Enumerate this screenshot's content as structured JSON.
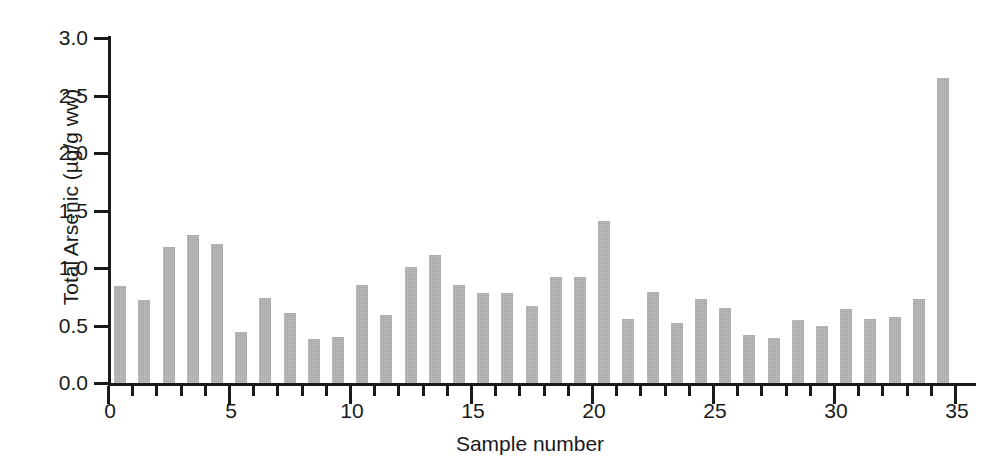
{
  "chart_data": {
    "type": "bar",
    "title": "",
    "xlabel": "Sample number",
    "ylabel": "Total Arsenic (µg/g ww)",
    "xlim": [
      0,
      35
    ],
    "ylim": [
      0.0,
      3.0
    ],
    "grid": false,
    "legend": null,
    "bar_color": "#a6a6a6",
    "axis_color": "#1a1a1a",
    "background_color": "#ffffff",
    "ytick_labels": [
      "3.0",
      "2.5",
      "2.0",
      "1.5",
      "1.0",
      "0.5",
      "0.0"
    ],
    "ytick_values": [
      3.0,
      2.5,
      2.0,
      1.5,
      1.0,
      0.5,
      0.0
    ],
    "xtick_labels": [
      "0",
      "5",
      "10",
      "15",
      "20",
      "25",
      "30",
      "35"
    ],
    "xtick_values": [
      0,
      5,
      10,
      15,
      20,
      25,
      30,
      35
    ],
    "x_minor_tick_interval": 1,
    "categories": [
      1,
      2,
      3,
      4,
      5,
      6,
      7,
      8,
      9,
      10,
      11,
      12,
      13,
      14,
      15,
      16,
      17,
      18,
      19,
      20,
      21,
      22,
      23,
      24,
      25,
      26,
      27,
      28,
      29,
      30,
      31,
      32,
      33,
      34,
      35
    ],
    "values": [
      0.84,
      0.72,
      1.18,
      1.29,
      1.21,
      0.44,
      0.74,
      0.61,
      0.38,
      0.4,
      0.85,
      0.59,
      1.01,
      1.11,
      0.85,
      0.78,
      0.78,
      0.67,
      0.92,
      0.92,
      1.41,
      0.56,
      0.79,
      0.52,
      0.73,
      0.65,
      0.42,
      0.39,
      0.55,
      0.5,
      0.64,
      0.56,
      0.57,
      0.73,
      2.65
    ]
  }
}
